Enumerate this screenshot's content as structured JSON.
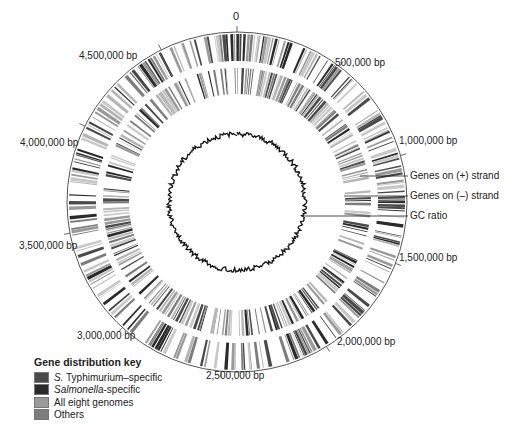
{
  "diagram": {
    "type": "circular-genome-map",
    "genome_length_bp": 4857000,
    "center": [
      237,
      202
    ],
    "tick_labels": [
      {
        "label": "0",
        "pos_bp": 0
      },
      {
        "label": "500,000 bp",
        "pos_bp": 500000
      },
      {
        "label": "1,000,000 bp",
        "pos_bp": 1000000
      },
      {
        "label": "1,500,000 bp",
        "pos_bp": 1500000
      },
      {
        "label": "2,000,000 bp",
        "pos_bp": 2000000
      },
      {
        "label": "2,500,000 bp",
        "pos_bp": 2500000
      },
      {
        "label": "3,000,000 bp",
        "pos_bp": 3000000
      },
      {
        "label": "3,500,000 bp",
        "pos_bp": 3500000
      },
      {
        "label": "4,000,000 bp",
        "pos_bp": 4000000
      },
      {
        "label": "4,500,000 bp",
        "pos_bp": 4500000
      }
    ],
    "track_labels": {
      "plus_strand": "Genes on (+) strand",
      "minus_strand": "Genes on (–) strand",
      "gc": "GC ratio"
    },
    "tracks": [
      {
        "name": "Genes on (+) strand",
        "r_inner": 141,
        "r_outer": 168
      },
      {
        "name": "Genes on (-) strand",
        "r_inner": 108,
        "r_outer": 134
      },
      {
        "name": "GC ratio",
        "r_base": 68
      }
    ]
  },
  "legend": {
    "title": "Gene distribution key",
    "items": [
      {
        "italic": "S.",
        "rest": " Typhimurium–specific",
        "color": "#4a4a4a"
      },
      {
        "italic": "Salmonella",
        "rest": "-specific",
        "color": "#2b2b2b"
      },
      {
        "italic": "",
        "rest": "All eight genomes",
        "color": "#9a9a9a"
      },
      {
        "italic": "",
        "rest": "Others",
        "color": "#7d7d7d"
      }
    ]
  },
  "colors": {
    "s_typhimurium_specific": "#4a4a4a",
    "salmonella_specific": "#2b2b2b",
    "all_eight_genomes": "#9a9a9a",
    "others": "#7d7d7d",
    "circle_line": "#555555",
    "gc_line": "#111111"
  }
}
